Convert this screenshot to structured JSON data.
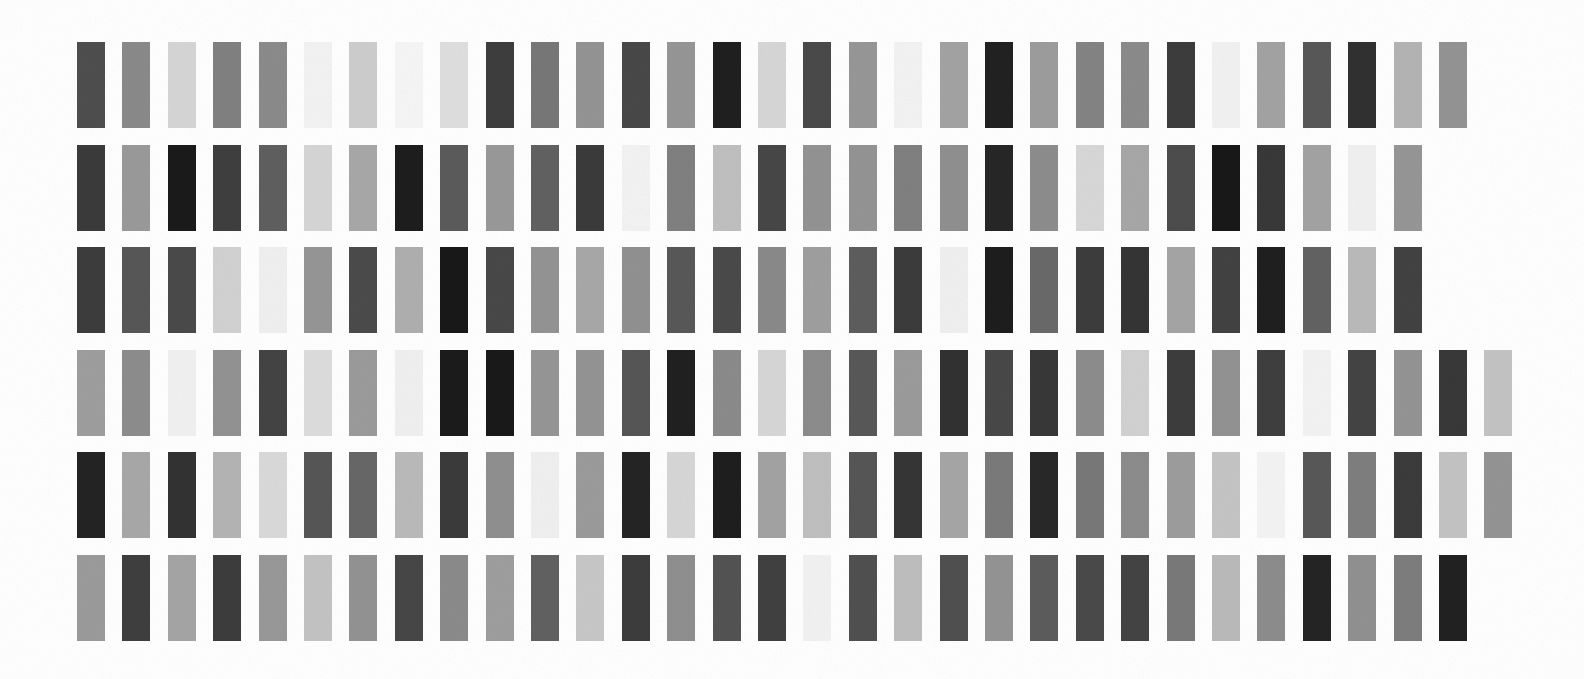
{
  "page": {
    "background_color": "#ffffff",
    "width": 1584,
    "height": 679
  },
  "grid": {
    "rows": 6,
    "columns": 32,
    "swatch_width": 28,
    "swatch_height": 86,
    "column_pitch": 45.4,
    "row_pitch": 102.5,
    "origin_x": 77,
    "origin_y": 42,
    "texture": "film-grain"
  },
  "chart_data": {
    "type": "heatmap",
    "xlabel": "",
    "ylabel": "",
    "rows": 6,
    "columns": 32,
    "colormap": "grayscale",
    "value_range": [
      0,
      255
    ],
    "series": [
      {
        "name": "row-1",
        "values": [
          78,
          138,
          214,
          129,
          139,
          243,
          206,
          246,
          223,
          61,
          119,
          148,
          72,
          150,
          31,
          215,
          73,
          151,
          243,
          163,
          33,
          157,
          132,
          139,
          60,
          242,
          163,
          88,
          48,
          180,
          148,
          0
        ]
      },
      {
        "name": "row-2",
        "values": [
          58,
          154,
          26,
          62,
          95,
          214,
          168,
          29,
          91,
          153,
          97,
          58,
          243,
          128,
          192,
          71,
          147,
          148,
          128,
          144,
          38,
          141,
          216,
          167,
          76,
          24,
          56,
          163,
          241,
          150,
          0,
          0
        ]
      },
      {
        "name": "row-3",
        "values": [
          60,
          87,
          74,
          210,
          240,
          150,
          75,
          175,
          24,
          72,
          148,
          168,
          145,
          88,
          74,
          138,
          159,
          93,
          59,
          240,
          29,
          105,
          60,
          52,
          165,
          66,
          31,
          98,
          186,
          66,
          0,
          0
        ]
      },
      {
        "name": "row-4",
        "values": [
          158,
          141,
          241,
          146,
          67,
          221,
          155,
          240,
          27,
          25,
          150,
          148,
          85,
          32,
          139,
          215,
          140,
          88,
          155,
          49,
          72,
          55,
          141,
          210,
          60,
          146,
          62,
          243,
          68,
          148,
          56,
          196
        ]
      },
      {
        "name": "row-5",
        "values": [
          35,
          168,
          50,
          180,
          218,
          86,
          103,
          186,
          58,
          143,
          240,
          155,
          36,
          215,
          30,
          163,
          192,
          86,
          53,
          166,
          122,
          40,
          120,
          140,
          157,
          197,
          244,
          88,
          126,
          59,
          196,
          148
        ]
      },
      {
        "name": "row-6",
        "values": [
          155,
          62,
          165,
          60,
          152,
          196,
          147,
          70,
          139,
          158,
          97,
          200,
          60,
          143,
          83,
          64,
          242,
          80,
          190,
          79,
          148,
          92,
          73,
          67,
          121,
          186,
          141,
          36,
          145,
          125,
          33,
          0
        ]
      }
    ],
    "row_labels": [
      "row-1",
      "row-2",
      "row-3",
      "row-4",
      "row-5",
      "row-6"
    ],
    "column_labels": [
      "1",
      "2",
      "3",
      "4",
      "5",
      "6",
      "7",
      "8",
      "9",
      "10",
      "11",
      "12",
      "13",
      "14",
      "15",
      "16",
      "17",
      "18",
      "19",
      "20",
      "21",
      "22",
      "23",
      "24",
      "25",
      "26",
      "27",
      "28",
      "29",
      "30",
      "31",
      "32"
    ]
  }
}
